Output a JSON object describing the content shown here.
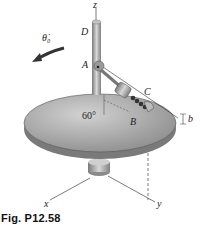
{
  "figure": {
    "caption": "Fig. P12.58",
    "labels": {
      "z": "z",
      "D": "D",
      "theta": "θ̇₀",
      "A": "A",
      "C": "C",
      "B": "B",
      "b": "b",
      "angle": "60°",
      "x": "x",
      "y": "y"
    },
    "colors": {
      "disk_top": "#a9a9a9",
      "disk_edge": "#7d7d7d",
      "rod": "#9a9a9a",
      "line": "#333333"
    }
  }
}
